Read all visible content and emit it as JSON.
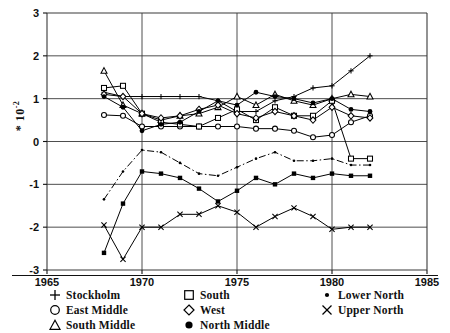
{
  "axes": {
    "y_label_prefix": "*",
    "y_label_base": "10",
    "y_label_exp": "-2",
    "x_ticks": [
      "1965",
      "1970",
      "1975",
      "1980",
      "1985"
    ],
    "y_ticks": [
      "3",
      "2",
      "1",
      "0",
      "-1",
      "-2",
      "-3"
    ]
  },
  "legend": {
    "columns": [
      [
        {
          "marker": "plus-marker",
          "label": "Stockholm"
        },
        {
          "marker": "circle-open-marker",
          "label": "East Middle"
        },
        {
          "marker": "triangle-open-marker",
          "label": "South Middle"
        }
      ],
      [
        {
          "marker": "square-open-marker",
          "label": "South"
        },
        {
          "marker": "diamond-open-marker",
          "label": "West"
        },
        {
          "marker": "circle-filled-marker",
          "label": "North Middle"
        }
      ],
      [
        {
          "marker": "dot-small-marker",
          "label": "Lower North"
        },
        {
          "marker": "cross-marker",
          "label": "Upper North"
        }
      ]
    ]
  },
  "chart_data": {
    "type": "line",
    "title": "",
    "xlabel": "",
    "ylabel": "* 10-2",
    "xlim": [
      1965,
      1985
    ],
    "ylim": [
      -3,
      3
    ],
    "xticks": [
      1965,
      1970,
      1975,
      1980,
      1985
    ],
    "yticks": [
      -3,
      -2,
      -1,
      0,
      1,
      2,
      3
    ],
    "grid": true,
    "value_scale": "1e-2",
    "legend_position": "below",
    "series": [
      {
        "name": "Stockholm",
        "marker": "plus",
        "linestyle": "solid",
        "x": [
          1968,
          1969,
          1970,
          1971,
          1972,
          1973,
          1974,
          1975,
          1976,
          1977,
          1978,
          1979,
          1980,
          1981,
          1982
        ],
        "values": [
          1.15,
          1.05,
          1.05,
          1.05,
          1.05,
          1.05,
          0.95,
          0.7,
          0.7,
          0.95,
          1.05,
          1.25,
          1.3,
          1.65,
          2.0
        ]
      },
      {
        "name": "East Middle",
        "marker": "circle-open",
        "linestyle": "solid",
        "x": [
          1968,
          1969,
          1970,
          1971,
          1972,
          1973,
          1974,
          1975,
          1976,
          1977,
          1978,
          1979,
          1980,
          1981,
          1982
        ],
        "values": [
          0.62,
          0.6,
          0.35,
          0.35,
          0.35,
          0.35,
          0.35,
          0.35,
          0.3,
          0.3,
          0.25,
          0.1,
          0.15,
          0.45,
          0.6
        ]
      },
      {
        "name": "South Middle",
        "marker": "triangle-open",
        "linestyle": "solid",
        "x": [
          1968,
          1969,
          1970,
          1971,
          1972,
          1973,
          1974,
          1975,
          1976,
          1977,
          1978,
          1979,
          1980,
          1981,
          1982
        ],
        "values": [
          1.65,
          0.85,
          0.65,
          0.5,
          0.6,
          0.65,
          0.8,
          1.05,
          0.85,
          1.1,
          0.95,
          0.85,
          1.0,
          1.1,
          1.05
        ]
      },
      {
        "name": "South",
        "marker": "square-open",
        "linestyle": "solid",
        "x": [
          1968,
          1969,
          1970,
          1971,
          1972,
          1973,
          1974,
          1975,
          1976,
          1977,
          1978,
          1979,
          1980,
          1981,
          1982
        ],
        "values": [
          1.25,
          1.3,
          0.65,
          0.45,
          0.4,
          0.35,
          0.55,
          0.75,
          0.5,
          0.8,
          0.6,
          0.6,
          0.95,
          -0.4,
          -0.4
        ]
      },
      {
        "name": "West",
        "marker": "diamond-open",
        "linestyle": "solid",
        "x": [
          1968,
          1969,
          1970,
          1971,
          1972,
          1973,
          1974,
          1975,
          1976,
          1977,
          1978,
          1979,
          1980,
          1981,
          1982
        ],
        "values": [
          1.1,
          1.05,
          0.65,
          0.55,
          0.6,
          0.75,
          0.85,
          0.65,
          0.55,
          0.7,
          0.6,
          0.5,
          0.8,
          0.6,
          0.55
        ]
      },
      {
        "name": "North Middle",
        "marker": "circle-filled",
        "linestyle": "solid",
        "x": [
          1968,
          1969,
          1970,
          1971,
          1972,
          1973,
          1974,
          1975,
          1976,
          1977,
          1978,
          1979,
          1980,
          1981,
          1982
        ],
        "values": [
          1.05,
          0.8,
          0.25,
          0.4,
          0.45,
          0.7,
          0.95,
          0.85,
          1.15,
          1.05,
          1.0,
          0.9,
          1.0,
          0.75,
          0.7
        ]
      },
      {
        "name": "Lower North",
        "marker": "dot-small",
        "linestyle": "dashdot",
        "x": [
          1968,
          1969,
          1970,
          1971,
          1972,
          1973,
          1974,
          1975,
          1976,
          1977,
          1978,
          1979,
          1980,
          1981,
          1982
        ],
        "values": [
          -1.35,
          -0.7,
          -0.2,
          -0.25,
          -0.5,
          -0.75,
          -0.8,
          -0.6,
          -0.4,
          -0.25,
          -0.45,
          -0.45,
          -0.4,
          -0.55,
          -0.55
        ]
      },
      {
        "name": "Lower North Solid",
        "marker": "square-filled",
        "linestyle": "solid",
        "x": [
          1968,
          1969,
          1970,
          1971,
          1972,
          1973,
          1974,
          1975,
          1976,
          1977,
          1978,
          1979,
          1980,
          1981,
          1982
        ],
        "values": [
          -2.6,
          -1.45,
          -0.7,
          -0.75,
          -0.85,
          -1.1,
          -1.4,
          -1.15,
          -0.85,
          -1.0,
          -0.75,
          -0.85,
          -0.75,
          -0.8,
          -0.8
        ]
      },
      {
        "name": "Upper North",
        "marker": "cross",
        "linestyle": "solid",
        "x": [
          1968,
          1969,
          1970,
          1971,
          1972,
          1973,
          1974,
          1975,
          1976,
          1977,
          1978,
          1979,
          1980,
          1981,
          1982
        ],
        "values": [
          -1.95,
          -2.75,
          -2.0,
          -2.0,
          -1.7,
          -1.7,
          -1.5,
          -1.65,
          -2.0,
          -1.75,
          -1.55,
          -1.75,
          -2.05,
          -2.0,
          -2.0
        ]
      }
    ]
  }
}
